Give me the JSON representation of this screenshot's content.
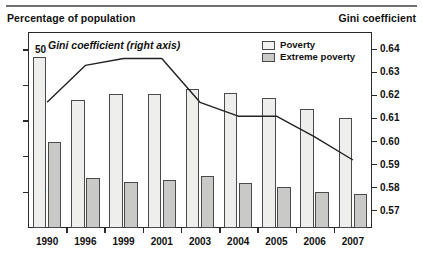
{
  "header": {
    "left_title": "Percentage of population",
    "right_title": "Gini coefficient"
  },
  "legend": {
    "items": [
      {
        "label": "Poverty",
        "color": "#f2f2f0"
      },
      {
        "label": "Extreme poverty",
        "color": "#c9c9c7"
      }
    ]
  },
  "annotation": "Gini coefficient (right axis)",
  "chart_data": {
    "type": "bar",
    "title": "",
    "xlabel": "",
    "ylabel": "Percentage of population",
    "y2label": "Gini coefficient",
    "categories": [
      "1990",
      "1996",
      "1999",
      "2001",
      "2003",
      "2004",
      "2005",
      "2006",
      "2007"
    ],
    "series": [
      {
        "name": "Poverty",
        "type": "bar",
        "axis": "left",
        "color": "#eeeeec",
        "values": [
          48.0,
          36.0,
          37.5,
          37.5,
          39.0,
          38.0,
          36.5,
          33.5,
          31.0
        ]
      },
      {
        "name": "Extreme poverty",
        "type": "bar",
        "axis": "left",
        "color": "#c9c9c7",
        "values": [
          24.0,
          14.0,
          13.0,
          13.5,
          14.5,
          12.5,
          11.5,
          10.0,
          9.5
        ]
      },
      {
        "name": "Gini coefficient (right axis)",
        "type": "line",
        "axis": "right",
        "color": "#222222",
        "values": [
          0.617,
          0.633,
          0.636,
          0.636,
          0.617,
          0.611,
          0.611,
          0.602,
          0.592
        ]
      }
    ],
    "ylim": [
      0,
      55
    ],
    "yticks": [
      10,
      20,
      30,
      40,
      50
    ],
    "ytick_labels": [
      "10",
      "20",
      "30",
      "40",
      "50"
    ],
    "y2lim": [
      0.5625,
      0.6475
    ],
    "y2ticks": [
      0.57,
      0.58,
      0.59,
      0.6,
      0.61,
      0.62,
      0.63,
      0.64
    ],
    "y2tick_labels": [
      "0.57",
      "0.58",
      "0.59",
      "0.60",
      "0.61",
      "0.62",
      "0.63",
      "0.64"
    ],
    "grid": false,
    "legend_position": "top-right"
  }
}
